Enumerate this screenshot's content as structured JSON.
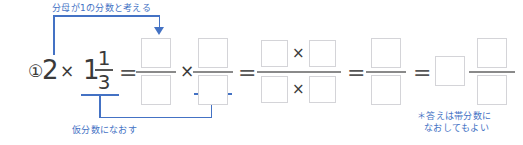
{
  "page": {
    "background_color": "#ffffff",
    "annotation_color": "#4472c4",
    "math_color": "#3a3a3a",
    "box_border_color": "#d4d4d8",
    "rule_color": "#8a8a8a"
  },
  "annotations": {
    "top": "分母が1の分数と考える",
    "bottom": "仮分数になおす",
    "note_line1": "＊答えは帯分数に",
    "note_line2": "なおしてもよい"
  },
  "expression": {
    "item_number": "①",
    "whole_factor": "2",
    "times_symbol": "×",
    "equals_symbol": "=",
    "mixed_whole": "1",
    "mixed_numerator": "1",
    "mixed_denominator": "3",
    "cross_symbol": "×"
  },
  "steps": [
    {
      "id": "step-1",
      "kind": "product-of-fractions",
      "left_fraction": {
        "numerator": "",
        "denominator": ""
      },
      "operator": "×",
      "right_fraction": {
        "numerator": "",
        "denominator": ""
      }
    },
    {
      "id": "step-2",
      "kind": "single-fraction-with-products",
      "numerator": [
        "",
        "×",
        ""
      ],
      "denominator": [
        "",
        "×",
        ""
      ]
    },
    {
      "id": "step-3",
      "kind": "single-fraction",
      "numerator": "",
      "denominator": ""
    },
    {
      "id": "step-4",
      "kind": "mixed-number",
      "whole": "",
      "numerator": "",
      "denominator": ""
    }
  ]
}
